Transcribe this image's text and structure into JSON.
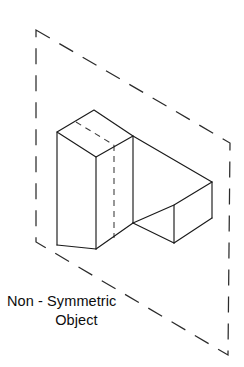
{
  "figure": {
    "caption": {
      "line1": "Non - Symmetric",
      "line2": "Object"
    },
    "colors": {
      "background": "#ffffff",
      "solid_edge": "#1a1a1a",
      "hidden_edge": "#3a3a3a",
      "plane_outline": "#2b2b2b",
      "face_fill": "#ffffff",
      "caption_text": "#0d0d0d"
    },
    "symmetry_plane": {
      "label": "symmetry-plane",
      "style": "dashed",
      "shape": "parallelogram",
      "corners": [
        [
          36,
          30
        ],
        [
          230,
          143
        ],
        [
          228,
          355
        ],
        [
          36,
          242
        ]
      ]
    },
    "object": {
      "label": "L-shaped block",
      "type": "isometric-solid",
      "description": "Tall rectangular prism on the left joined to a lower rectangular prism extending to the right",
      "tall_block": {
        "top_face": [
          [
            94,
            110
          ],
          [
            57,
            132
          ],
          [
            96,
            157
          ],
          [
            133,
            136
          ]
        ],
        "front_bottom": [
          96,
          249
        ],
        "left_bottom": [
          57,
          245
        ]
      },
      "low_block": {
        "top_face": [
          [
            133,
            136
          ],
          [
            171,
            158
          ],
          [
            212,
            182
          ],
          [
            174,
            205
          ]
        ],
        "right_bottom": [
          212,
          218
        ],
        "front_bottom": [
          174,
          243
        ]
      },
      "hidden_edges": [
        {
          "name": "vertical-hidden-edge",
          "from": [
            114,
            145
          ],
          "to": [
            114,
            238
          ]
        },
        {
          "name": "top-face-hidden-edge",
          "from": [
            76,
            122
          ],
          "to": [
            114,
            145
          ]
        }
      ]
    }
  }
}
